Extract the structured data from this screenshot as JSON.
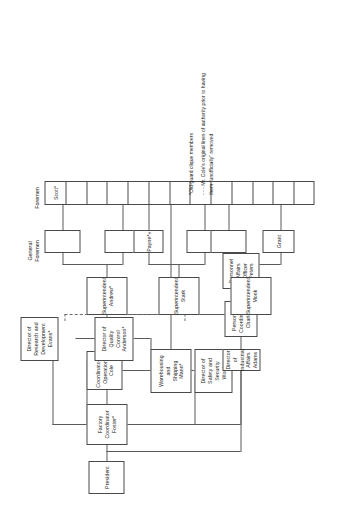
{
  "chart_title": "Factory Organization Chart",
  "columns": {
    "general_foremen_label": "General\nForemen",
    "foremen_label": "Foremen"
  },
  "nodes": {
    "president": "President",
    "factory_coordinator": "Factory\nCoordinator\nFoster*",
    "coordinator_operations": "Coordinator of\nOperations\nCole",
    "director_rd": "Director of\nResearch and\nDevelopment\nEvans*",
    "director_qc": "Director of\nQuality\nControl\nAnderson*",
    "warehousing": "Warehousing\nand\nShipping\nMann*",
    "director_safety": "Director of\nSafety and\nSecurity\nWorthy",
    "director_industrial": "Director of\nIndustrial\nAffairs\nAdams",
    "personnel_coordinator": "Personnel\nCoordinator\nCharles",
    "personnel_officer": "Personnel\nAffairs\nOfficer\nPeters",
    "supt_andrew": "Superintendent\nAndrew*",
    "supt_stark": "Superintendent\nStark",
    "supt_monk": "Superintendent\nMonk",
    "gf_1": "",
    "gf_2": "",
    "gf_payne": "Payne*+",
    "gf_4": "",
    "gf_5": "",
    "gf_grant": "Grant",
    "foreman_scott": "Scott*"
  },
  "foremen_cells": [
    "Scott*",
    "",
    "",
    "",
    "",
    "",
    "",
    "",
    "",
    "",
    "",
    "",
    ""
  ],
  "footnotes": [
    "*Old-guard clique members",
    "- - - Mr. Cole's original lines of authority prior to having",
    "      them \"unofficially\" removed"
  ],
  "colors": {
    "line": "#5a5a5a",
    "box_border": "#4a4a4a",
    "text": "#1a1a1a",
    "background": "#ffffff"
  }
}
